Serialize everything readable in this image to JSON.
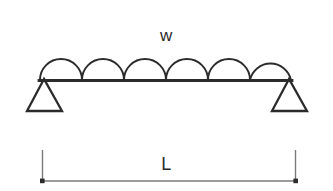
{
  "diagram": {
    "type": "simply-supported-beam-udl",
    "background_color": "#ffffff",
    "line_color": "#2b2b2b",
    "dimension_line_color": "#6f6f6f",
    "labels": {
      "load_label": "w",
      "span_label": "L"
    },
    "beam": {
      "left_x": 40,
      "right_x": 291,
      "y": 80,
      "stroke_width": 2.6
    },
    "distributed_load": {
      "arc_count": 6,
      "arc_start_x": 40,
      "arc_end_x": 291,
      "arc_radius": 21,
      "baseline_y": 80,
      "stroke_width": 1.9
    },
    "supports": [
      {
        "name": "left-pin-support",
        "apex_x": 44,
        "apex_y": 80,
        "base_left_x": 27,
        "base_right_x": 62,
        "base_y": 111
      },
      {
        "name": "right-pin-support",
        "apex_x": 289,
        "apex_y": 80,
        "base_left_x": 272,
        "base_right_x": 307,
        "base_y": 111
      }
    ],
    "dimension": {
      "left_x": 42,
      "right_x": 296,
      "line_y": 181,
      "tick_top_y": 150,
      "tick_stroke_width": 1.3,
      "line_stroke_width": 1.6,
      "endpoint_marker_size": 3.4
    }
  }
}
